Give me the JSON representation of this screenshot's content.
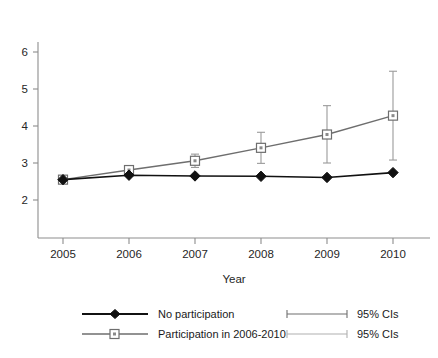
{
  "chart_data": {
    "type": "line",
    "title": "",
    "subtitle": "",
    "xlabel": "Year",
    "ylabel": "",
    "x": [
      2005,
      2006,
      2007,
      2008,
      2009,
      2010
    ],
    "categories": [
      "2005",
      "2006",
      "2007",
      "2008",
      "2009",
      "2010"
    ],
    "xlim": [
      2004.6,
      2010.6
    ],
    "ylim": [
      1.6,
      6.4
    ],
    "xticks": [
      2005,
      2006,
      2007,
      2008,
      2009,
      2010
    ],
    "xtick_labels": [
      "2005",
      "2006",
      "2007",
      "2008",
      "2009",
      "2010"
    ],
    "yticks": [
      2,
      3,
      4,
      5,
      6
    ],
    "ytick_labels": [
      "2",
      "3",
      "4",
      "5",
      "6"
    ],
    "grid": false,
    "legend_position": "below-bottom-center",
    "series": [
      {
        "name": "No participation",
        "marker": "filled-diamond",
        "color": "#111111",
        "values": [
          2.55,
          2.67,
          2.65,
          2.64,
          2.61,
          2.74
        ],
        "error_bars": null
      },
      {
        "name": "Participation in 2006-2010",
        "marker": "open-square",
        "color": "#6e6e6e",
        "values": [
          2.55,
          2.81,
          3.06,
          3.41,
          3.77,
          4.28
        ],
        "error_bars": {
          "label": "95% CIs",
          "lower": [
            2.55,
            2.72,
            2.88,
            2.99,
            3.0,
            3.08
          ],
          "upper": [
            2.55,
            2.9,
            3.24,
            3.83,
            4.55,
            5.48
          ]
        }
      }
    ],
    "annotations": []
  },
  "axes": {
    "x_title": "Year"
  },
  "legend": {
    "rows": [
      {
        "series_label": "No participation",
        "ci_label": "95% CIs"
      },
      {
        "series_label": "Participation in 2006-2010",
        "ci_label": "95% CIs"
      }
    ]
  },
  "colors": {
    "series_no_participation": "#111111",
    "series_participation": "#6e6e6e",
    "error_bar": "#9a9a9a",
    "axis": "#8d8d8d",
    "background": "#ffffff",
    "text": "#1a1a1a"
  }
}
